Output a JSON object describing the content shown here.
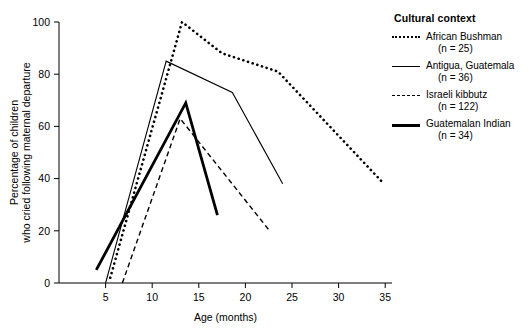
{
  "chart_data": {
    "type": "line",
    "title": "",
    "xlabel": "Age (months)",
    "ylabel": "Percentage of children who cried following maternal departure",
    "ylabel_line1": "Percentage of children",
    "ylabel_line2": "who cried following maternal departure",
    "xlim": [
      0,
      37
    ],
    "ylim": [
      0,
      100
    ],
    "xticks": [
      5,
      10,
      15,
      20,
      25,
      30,
      35
    ],
    "yticks": [
      0,
      20,
      40,
      60,
      80,
      100
    ],
    "grid": false,
    "legend_position": "right",
    "legend_title": "Cultural context",
    "series": [
      {
        "name": "African Bushman",
        "n_label": "(n = 25)",
        "n": 25,
        "style": "dotted",
        "width": 2.6,
        "color": "#000000",
        "points": [
          [
            5.5,
            2
          ],
          [
            13.2,
            100
          ],
          [
            17.5,
            88
          ],
          [
            23.5,
            81
          ],
          [
            34.6,
            39
          ]
        ]
      },
      {
        "name": "Antigua, Guatemala",
        "n_label": "(n = 36)",
        "n": 36,
        "style": "solid-thin",
        "width": 1.1,
        "color": "#000000",
        "points": [
          [
            5.0,
            0
          ],
          [
            11.5,
            85
          ],
          [
            18.6,
            73
          ],
          [
            24.0,
            38
          ]
        ]
      },
      {
        "name": "Israeli kibbutz",
        "n_label": "(n = 122)",
        "n": 122,
        "style": "dashed",
        "width": 1.4,
        "color": "#000000",
        "points": [
          [
            6.8,
            0
          ],
          [
            13.0,
            63
          ],
          [
            22.6,
            20
          ]
        ]
      },
      {
        "name": "Guatemalan Indian",
        "n_label": "(n = 34)",
        "n": 34,
        "style": "solid-thick",
        "width": 2.8,
        "color": "#000000",
        "points": [
          [
            4.0,
            5
          ],
          [
            13.6,
            69
          ],
          [
            17.0,
            26
          ]
        ]
      }
    ]
  }
}
